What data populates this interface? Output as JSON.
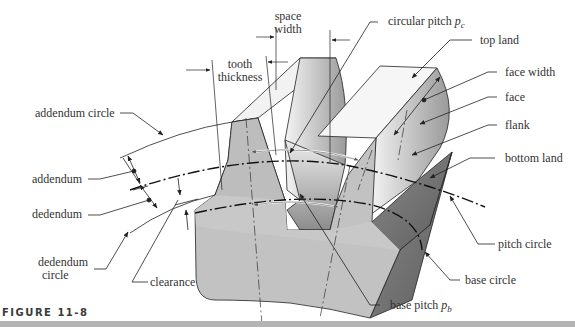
{
  "figure": {
    "caption": "FIGURE 11-8",
    "colors": {
      "gear_body": "#c2c2c2",
      "gear_dark": "#7a7a7a",
      "line": "#222222",
      "label_text": "#333333",
      "caption_bar": "#b5b5b5"
    }
  },
  "labels": {
    "space_width_1": "space",
    "space_width_2": "width",
    "tooth_thickness_1": "tooth",
    "tooth_thickness_2": "thickness",
    "circular_pitch": "circular pitch",
    "circular_pitch_sym": "p",
    "circular_pitch_sub": "c",
    "top_land": "top land",
    "face_width": "face width",
    "face": "face",
    "flank": "flank",
    "bottom_land": "bottom land",
    "addendum_circle": "addendum circle",
    "addendum": "addendum",
    "dedendum": "dedendum",
    "dedendum_circle_1": "dedendum",
    "dedendum_circle_2": "circle",
    "clearance": "clearance",
    "pitch_circle": "pitch circle",
    "base_circle": "base circle",
    "base_pitch": "base pitch",
    "base_pitch_sym": "p",
    "base_pitch_sub": "b"
  }
}
